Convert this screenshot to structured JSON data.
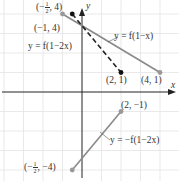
{
  "axes": {
    "x_label": "x",
    "y_label": "y",
    "origin_px": [
      82,
      92
    ],
    "unit_px": 19.5
  },
  "curves": [
    {
      "name": "y = f(1 - x)",
      "label": "y = f(1−x)",
      "style": "solid",
      "color": "#888888",
      "from": [
        -1,
        4
      ],
      "to": [
        4,
        1
      ]
    },
    {
      "name": "y = f(1 - 2x)",
      "label": "y = f(1−2x)",
      "style": "dashed",
      "color": "#222222",
      "from": [
        -0.5,
        4
      ],
      "to": [
        2,
        1
      ]
    },
    {
      "name": "y = -f(1 - 2x)",
      "label": "y = −f(1−2x)",
      "style": "solid",
      "color": "#888888",
      "from": [
        -0.5,
        -4
      ],
      "to": [
        2,
        -1
      ]
    }
  ],
  "points": [
    {
      "label": "(−1, 4)",
      "x": -1,
      "y": 4,
      "fill": "#999999"
    },
    {
      "label_prefix": "(−",
      "label_num": "1",
      "label_den": "2",
      "label_suffix": ", 4)",
      "x": -0.5,
      "y": 4,
      "fill": "#111111"
    },
    {
      "label": "(2, 1)",
      "x": 2,
      "y": 1,
      "fill": "#111111"
    },
    {
      "label": "(4, 1)",
      "x": 4,
      "y": 1,
      "fill": "#999999"
    },
    {
      "label": "(2, −1)",
      "x": 2,
      "y": -1,
      "fill": "#999999"
    },
    {
      "label_prefix": "(−",
      "label_num": "1",
      "label_den": "2",
      "label_suffix": ", −4)",
      "x": -0.5,
      "y": -4,
      "fill": "#999999"
    }
  ],
  "labels": {
    "curve1": "y = f(1−x)",
    "curve2": "y = f(1−2x)",
    "curve3": "y = −f(1−2x)",
    "p_m1_4": "(−1, 4)",
    "p_2_1": "(2, 1)",
    "p_4_1": "(4, 1)",
    "p_2_m1": "(2, −1)",
    "half_prefix": "(−",
    "half_num": "1",
    "half_den": "2",
    "half_suffix_top": ", 4)",
    "half_suffix_bot": ", −4)"
  }
}
